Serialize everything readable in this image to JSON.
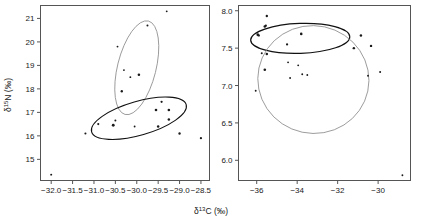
{
  "figure": {
    "xlabel_main": "δ",
    "xlabel_sup": "13",
    "xlabel_rest": "C (‰)",
    "ylabel_main": "δ",
    "ylabel_sup": "15",
    "ylabel_rest": "N (‰)",
    "background": "#ffffff",
    "frame_color": "#555555",
    "point_color": "#1a1a1a",
    "ellipse_dark": "#111111",
    "ellipse_light": "#8c8c8c"
  },
  "chart_data": [
    {
      "type": "scatter",
      "panel": "left",
      "title": "",
      "xlabel": "δ13C (‰)",
      "ylabel": "δ15N (‰)",
      "xlim": [
        -32.25,
        -28.3
      ],
      "ylim": [
        14.1,
        21.55
      ],
      "grid": false,
      "legend": "none",
      "xticks": [
        -32.0,
        -31.5,
        -31.0,
        -30.5,
        -30.0,
        -29.5,
        -29.0,
        -28.5
      ],
      "xticklabels": [
        "−32.0",
        "−31.5",
        "−31.0",
        "−30.5",
        "−30.0",
        "−29.5",
        "−29.0",
        "−28.5"
      ],
      "yticks": [
        15,
        16,
        17,
        18,
        19,
        20,
        21
      ],
      "yticklabels": [
        "15",
        "16",
        "17",
        "18",
        "19",
        "20",
        "21"
      ],
      "points": [
        {
          "x": -32.0,
          "y": 14.35,
          "size": 1.6
        },
        {
          "x": -31.2,
          "y": 16.1,
          "size": 1.7
        },
        {
          "x": -30.9,
          "y": 16.5,
          "size": 1.7
        },
        {
          "x": -30.55,
          "y": 16.45,
          "size": 2.3
        },
        {
          "x": -30.5,
          "y": 16.65,
          "size": 1.6
        },
        {
          "x": -30.45,
          "y": 19.8,
          "size": 1.5
        },
        {
          "x": -30.35,
          "y": 17.9,
          "size": 1.9
        },
        {
          "x": -30.3,
          "y": 18.8,
          "size": 1.5
        },
        {
          "x": -30.15,
          "y": 18.5,
          "size": 1.5
        },
        {
          "x": -30.05,
          "y": 16.4,
          "size": 1.5
        },
        {
          "x": -29.95,
          "y": 18.6,
          "size": 2.1
        },
        {
          "x": -29.75,
          "y": 20.7,
          "size": 1.6
        },
        {
          "x": -29.55,
          "y": 17.1,
          "size": 2.1
        },
        {
          "x": -29.5,
          "y": 16.4,
          "size": 2.0
        },
        {
          "x": -29.42,
          "y": 17.45,
          "size": 1.8
        },
        {
          "x": -29.3,
          "y": 21.3,
          "size": 1.5
        },
        {
          "x": -29.25,
          "y": 17.1,
          "size": 2.1
        },
        {
          "x": -29.25,
          "y": 16.7,
          "size": 2.0
        },
        {
          "x": -29.0,
          "y": 16.1,
          "size": 1.9
        },
        {
          "x": -28.5,
          "y": 15.9,
          "size": 1.8
        }
      ],
      "ellipses": [
        {
          "name": "upper-ellipse",
          "cx": -30.0,
          "cy": 18.9,
          "rx": 0.45,
          "ry": 2.05,
          "angle": 14,
          "color": "#8c8c8c",
          "width": 0.8
        },
        {
          "name": "lower-ellipse",
          "cx": -29.95,
          "cy": 16.75,
          "rx": 1.15,
          "ry": 0.72,
          "angle": -16,
          "color": "#111111",
          "width": 1.1
        }
      ]
    },
    {
      "type": "scatter",
      "panel": "right",
      "title": "",
      "xlabel": "δ13C (‰)",
      "ylabel": "",
      "xlim": [
        -36.9,
        -28.4
      ],
      "ylim": [
        5.73,
        8.07
      ],
      "grid": false,
      "legend": "none",
      "xticks": [
        -36,
        -34,
        -32,
        -30
      ],
      "xticklabels": [
        "−36",
        "−34",
        "−32",
        "−30"
      ],
      "yticks": [
        6.0,
        6.5,
        7.0,
        7.5,
        8.0
      ],
      "yticklabels": [
        "6.0",
        "6.5",
        "7.0",
        "7.5",
        "8.0"
      ],
      "points": [
        {
          "x": -35.95,
          "y": 7.68,
          "size": 2.1
        },
        {
          "x": -35.9,
          "y": 7.67,
          "size": 1.9
        },
        {
          "x": -36.05,
          "y": 6.93,
          "size": 1.5
        },
        {
          "x": -35.75,
          "y": 7.43,
          "size": 1.6
        },
        {
          "x": -35.6,
          "y": 7.79,
          "size": 2.1
        },
        {
          "x": -35.55,
          "y": 7.8,
          "size": 1.8
        },
        {
          "x": -35.5,
          "y": 7.93,
          "size": 1.9
        },
        {
          "x": -35.5,
          "y": 7.42,
          "size": 2.0
        },
        {
          "x": -35.6,
          "y": 7.21,
          "size": 2.1
        },
        {
          "x": -34.5,
          "y": 7.55,
          "size": 1.8
        },
        {
          "x": -34.45,
          "y": 7.31,
          "size": 1.5
        },
        {
          "x": -34.35,
          "y": 7.1,
          "size": 1.5
        },
        {
          "x": -33.95,
          "y": 7.27,
          "size": 1.5
        },
        {
          "x": -33.8,
          "y": 7.69,
          "size": 2.1
        },
        {
          "x": -33.75,
          "y": 7.15,
          "size": 1.5
        },
        {
          "x": -33.5,
          "y": 7.14,
          "size": 1.5
        },
        {
          "x": -31.2,
          "y": 7.5,
          "size": 2.0
        },
        {
          "x": -30.85,
          "y": 7.67,
          "size": 2.0
        },
        {
          "x": -30.5,
          "y": 7.13,
          "size": 1.5
        },
        {
          "x": -30.35,
          "y": 7.53,
          "size": 2.0
        },
        {
          "x": -29.9,
          "y": 7.18,
          "size": 1.6
        },
        {
          "x": -28.8,
          "y": 5.8,
          "size": 1.5
        }
      ],
      "ellipses": [
        {
          "name": "upper-ellipse",
          "cx": -33.85,
          "cy": 7.63,
          "rx": 2.45,
          "ry": 0.2,
          "angle": -2,
          "color": "#111111",
          "width": 1.2
        },
        {
          "name": "lower-ellipse",
          "cx": -33.2,
          "cy": 7.08,
          "rx": 2.75,
          "ry": 0.72,
          "angle": 12,
          "color": "#8c8c8c",
          "width": 0.8
        }
      ]
    }
  ]
}
